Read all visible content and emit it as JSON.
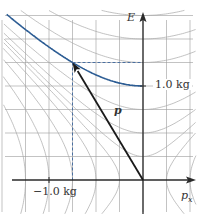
{
  "diagram": {
    "type": "energy-momentum diagram",
    "axes": {
      "vertical": {
        "label": "E"
      },
      "horizontal": {
        "label": "p",
        "subscript": "x"
      }
    },
    "tick_labels": {
      "energy": "1.0 kg",
      "momentum": "−1.0 kg"
    },
    "vector": {
      "label": "p",
      "from": [
        0,
        0
      ],
      "to": [
        -0.75,
        1.25
      ]
    },
    "mass_shell_highlight": {
      "mass": 1.0,
      "color": "#2d5d94"
    },
    "colors": {
      "grid": "#9a9a9a",
      "curves": "#a8a8a8",
      "axis": "#2a2a2a",
      "vector": "#1a1a1a",
      "dashed": "#4a6fa0",
      "highlight": "#2d5d94"
    },
    "geometry": {
      "origin_px": [
        143,
        180
      ],
      "unit_px": 94,
      "grid_step": 0.25
    }
  }
}
